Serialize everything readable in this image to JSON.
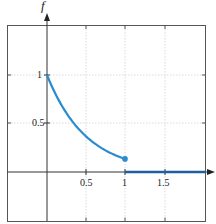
{
  "chart_data": {
    "type": "line",
    "title": "",
    "xlabel": "",
    "ylabel": "f",
    "xlim": [
      -0.6,
      1.95
    ],
    "ylim": [
      -0.5,
      1.5
    ],
    "grid": true,
    "legend": null,
    "x_ticks": [
      0.5,
      1,
      1.5
    ],
    "x_tick_labels": [
      "0.5",
      "1",
      "1.5"
    ],
    "y_ticks": [
      0.5,
      1
    ],
    "y_tick_labels": [
      "0.5",
      "1"
    ],
    "series": [
      {
        "name": "f(x) = e^(-2x) on [0,1]",
        "x": [
          0,
          0.1,
          0.2,
          0.3,
          0.4,
          0.5,
          0.6,
          0.7,
          0.8,
          0.9,
          1.0
        ],
        "y": [
          1.0,
          0.819,
          0.67,
          0.549,
          0.449,
          0.368,
          0.301,
          0.247,
          0.202,
          0.165,
          0.135
        ],
        "color": "#2a8ccf",
        "end_marker": {
          "x": 1.0,
          "y": 0.135,
          "filled": true
        }
      },
      {
        "name": "f(x) = 0 for x > 1",
        "x": [
          1.0,
          1.95
        ],
        "y": [
          0,
          0
        ],
        "color": "#1f5f9e"
      }
    ],
    "annotations": []
  },
  "labels": {
    "y_axis": "f",
    "x_ticks": [
      "0.5",
      "1",
      "1.5"
    ],
    "y_ticks": [
      "0.5",
      "1"
    ]
  },
  "colors": {
    "curve": "#2a8ccf",
    "zero_line": "#1f5f9e",
    "axes": "#333333",
    "grid": "#d0d0d0",
    "frame": "#555555"
  }
}
